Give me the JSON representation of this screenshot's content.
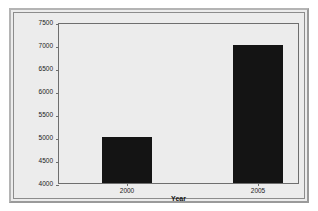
{
  "chart_data": {
    "type": "bar",
    "title": "",
    "subtitle": "",
    "categories": [
      "2000",
      "2005"
    ],
    "values": [
      5000,
      7000
    ],
    "series": [
      {
        "name": "Number of Adoptions from China",
        "values": [
          5000,
          7000
        ]
      }
    ],
    "xlabel": "Year",
    "ylabel": "Number of Adoptions from China",
    "ylim": [
      4000,
      7500
    ],
    "yticks": [
      4000,
      4500,
      5000,
      5500,
      6000,
      6500,
      7000,
      7500
    ],
    "ytick_labels": [
      "4000",
      "4500",
      "5000",
      "5500",
      "6000",
      "6500",
      "7000",
      "7500"
    ],
    "xtick_labels": [
      "2000",
      "2005"
    ],
    "grid": false,
    "legend": "none",
    "bar_color": "#141414",
    "plot_background": "#ececec",
    "frame_color": "#6e6e6e"
  }
}
